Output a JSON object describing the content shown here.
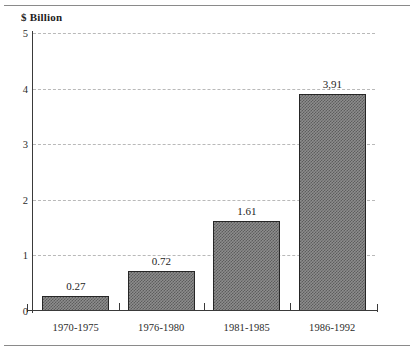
{
  "figure": {
    "axis_title": "$ Billion"
  },
  "chart_data": {
    "type": "bar",
    "title": "",
    "subtitle": "",
    "xlabel": "",
    "ylabel": "$ Billion",
    "categories": [
      "1970-1975",
      "1976-1980",
      "1981-1985",
      "1986-1992"
    ],
    "values": [
      0.27,
      0.72,
      1.61,
      3.91
    ],
    "value_labels": [
      "0.27",
      "0.72",
      "1.61",
      "3,91"
    ],
    "series": [
      {
        "name": "$ Billion",
        "values": [
          0.27,
          0.72,
          1.61,
          3.91
        ]
      }
    ],
    "ylim": [
      0,
      5
    ],
    "yticks": [
      0,
      1,
      2,
      3,
      4,
      5
    ],
    "ytick_labels": [
      "0",
      "1",
      "2",
      "3",
      "4",
      "5"
    ],
    "grid": true,
    "grid_axis": "y",
    "grid_style": "dashed",
    "legend": false,
    "legend_position": "none",
    "bar_fill": "#8d8d8d",
    "bar_edge": "#262626",
    "grid_color": "#b9b9b9",
    "axis_color": "#3a3a3a",
    "text_color": "#2b2b2b"
  }
}
